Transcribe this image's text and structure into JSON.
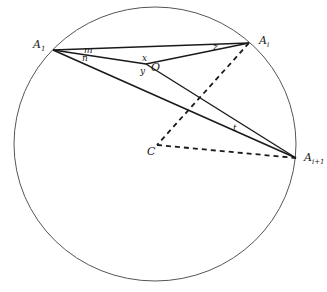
{
  "diagram": {
    "type": "geometry-circle-chords",
    "colors": {
      "stroke": "#1a1a1a",
      "circle": "#555555",
      "background": "#ffffff"
    },
    "circle": {
      "cx": 155,
      "cy": 144,
      "rx": 141,
      "ry": 137
    },
    "points": {
      "A1": {
        "label": "A",
        "sub": "1",
        "x": 53,
        "y": 50
      },
      "Ai": {
        "label": "A",
        "sub": "i",
        "x": 249,
        "y": 43
      },
      "Ai1": {
        "label": "A",
        "sub": "i+1",
        "x": 296,
        "y": 158
      },
      "O": {
        "label": "O",
        "x": 146,
        "y": 64
      },
      "C": {
        "label": "C",
        "x": 157,
        "y": 145
      }
    },
    "solid_segments": [
      [
        "A1",
        "Ai"
      ],
      [
        "A1",
        "O"
      ],
      [
        "O",
        "Ai"
      ],
      [
        "A1",
        "Ai1"
      ],
      [
        "O",
        "Ai1"
      ]
    ],
    "dashed_segments": [
      [
        "Ai",
        "C"
      ],
      [
        "C",
        "Ai1"
      ]
    ],
    "angle_labels": {
      "m": "m",
      "n": "n",
      "x": "x",
      "y": "y",
      "z": "z",
      "t": "t"
    }
  }
}
